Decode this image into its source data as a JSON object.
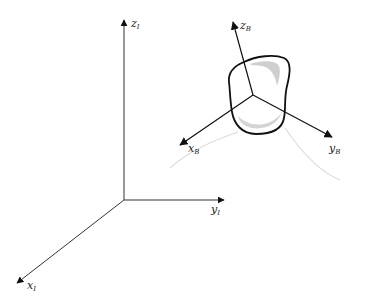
{
  "diagram": {
    "title": "",
    "colors": {
      "background": "#ffffff",
      "axis": "#222222",
      "body_outline": "#111111",
      "body_shading": "#c8c8c8",
      "trajectory": "#dcdcdc"
    },
    "inertial_frame": {
      "origin": [
        124,
        200
      ],
      "axes": [
        {
          "id": "x_I",
          "label": "x",
          "subscript": "I",
          "end": [
            17,
            283
          ],
          "label_pos": [
            28,
            287
          ]
        },
        {
          "id": "y_I",
          "label": "y",
          "subscript": "I",
          "end": [
            224,
            200
          ],
          "label_pos": [
            211,
            213
          ]
        },
        {
          "id": "z_I",
          "label": "z",
          "subscript": "I",
          "end": [
            124,
            20
          ],
          "label_pos": [
            131,
            27
          ]
        }
      ]
    },
    "body_frame": {
      "origin": [
        253,
        95
      ],
      "axes": [
        {
          "id": "x_B",
          "label": "x",
          "subscript": "B",
          "end": [
            180,
            145
          ],
          "label_pos": [
            188,
            150
          ]
        },
        {
          "id": "y_B",
          "label": "y",
          "subscript": "B",
          "end": [
            332,
            137
          ],
          "label_pos": [
            328,
            150
          ]
        },
        {
          "id": "z_B",
          "label": "z",
          "subscript": "B",
          "end": [
            233,
            22
          ],
          "label_pos": [
            240,
            29
          ]
        }
      ]
    }
  }
}
